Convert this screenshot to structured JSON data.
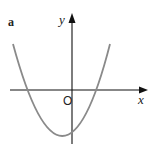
{
  "figure": {
    "part_label": "a",
    "x_axis_label": "x",
    "y_axis_label": "y",
    "origin_label": "O",
    "axis_color": "#111111",
    "curve_color": "#8a8a8a"
  },
  "curve": {
    "type": "parabola",
    "description": "upward-opening parabola with vertex below the x-axis, slightly left of the y-axis; two x-intercepts, one negative and one positive"
  }
}
